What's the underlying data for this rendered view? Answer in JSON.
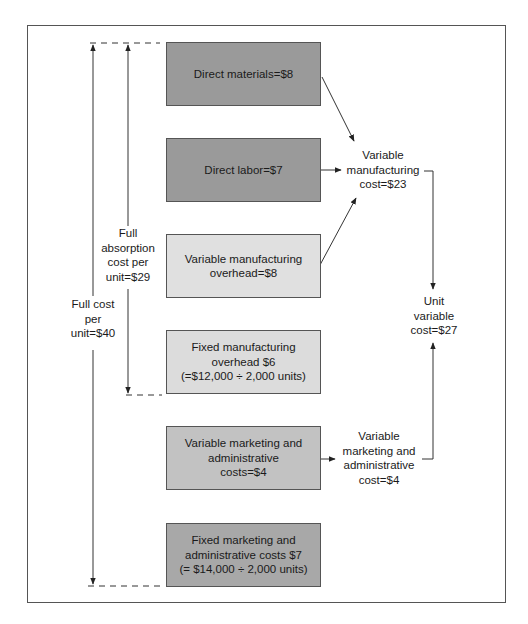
{
  "diagram": {
    "boxes": [
      {
        "id": "direct-materials",
        "text": "Direct materials=$8",
        "fill": "#9a9a9a"
      },
      {
        "id": "direct-labor",
        "text": "Direct labor=$7",
        "fill": "#9a9a9a"
      },
      {
        "id": "variable-mfg-overhead",
        "text": "Variable manufacturing\noverhead=$8",
        "fill": "#e0e0e0"
      },
      {
        "id": "fixed-mfg-overhead",
        "text": "Fixed manufacturing\noverhead $6\n(=$12,000 ÷ 2,000 units)",
        "fill": "#dcdcdc"
      },
      {
        "id": "variable-mkt-admin",
        "text": "Variable marketing and\nadministrative\ncosts=$4",
        "fill": "#c2c2c2"
      },
      {
        "id": "fixed-mkt-admin",
        "text": "Fixed marketing and\nadministrative costs $7\n(= $14,000 ÷ 2,000 units)",
        "fill": "#a8a8a8"
      }
    ],
    "labels": {
      "variable_mfg_cost": "Variable\nmanufacturing\ncost=$23",
      "unit_variable_cost": "Unit\nvariable\ncost=$27",
      "variable_mkt_admin_cost": "Variable\nmarketing and\nadministrative\ncost=$4",
      "full_absorption_cost": "Full\nabsorption\ncost per\nunit=$29",
      "full_cost": "Full cost\nper\nunit=$40"
    },
    "colors": {
      "line": "#333333",
      "frame": "#555555"
    }
  }
}
